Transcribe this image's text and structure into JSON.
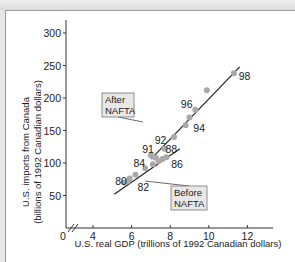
{
  "chart_data": {
    "type": "scatter",
    "title": "",
    "xlabel": "U.S. real GDP (trillions of 1992 Canadian dollars)",
    "ylabel": "U.S. imports from Canada (billions of 1992 Canadian dollars)",
    "ylabel_line1": "U.S. imports from Canada",
    "ylabel_line2": "(billions of 1992 Canadian dollars)",
    "xlim": [
      0,
      13
    ],
    "ylim": [
      0,
      320
    ],
    "x_ticks": [
      4,
      6,
      8,
      10,
      12
    ],
    "y_ticks": [
      50,
      100,
      150,
      200,
      250,
      300
    ],
    "origin_label": "0",
    "axis_break": true,
    "grid": false,
    "series": [
      {
        "name": "Before NAFTA",
        "points": [
          {
            "year": "80",
            "x": 5.6,
            "y": 70
          },
          {
            "year": "81",
            "x": 5.8,
            "y": 72
          },
          {
            "year": "82",
            "x": 5.9,
            "y": 76
          },
          {
            "year": "83",
            "x": 6.2,
            "y": 82
          },
          {
            "year": "84",
            "x": 6.7,
            "y": 92
          },
          {
            "year": "85",
            "x": 7.1,
            "y": 98
          },
          {
            "year": "86",
            "x": 7.4,
            "y": 103
          },
          {
            "year": "87",
            "x": 7.6,
            "y": 106
          },
          {
            "year": "88",
            "x": 7.8,
            "y": 109
          }
        ],
        "trend_line": {
          "x0": 5.1,
          "y0": 52,
          "x1": 8.5,
          "y1": 122
        }
      },
      {
        "name": "After NAFTA",
        "points": [
          {
            "year": "89",
            "x": 7.0,
            "y": 112
          },
          {
            "year": "90",
            "x": 7.1,
            "y": 110
          },
          {
            "year": "91",
            "x": 7.25,
            "y": 108
          },
          {
            "year": "92",
            "x": 7.7,
            "y": 122
          },
          {
            "year": "93",
            "x": 8.2,
            "y": 140
          },
          {
            "year": "94",
            "x": 8.8,
            "y": 158
          },
          {
            "year": "95",
            "x": 9.0,
            "y": 170
          },
          {
            "year": "96",
            "x": 9.3,
            "y": 182
          },
          {
            "year": "97",
            "x": 9.9,
            "y": 212
          },
          {
            "year": "98",
            "x": 11.3,
            "y": 238
          }
        ],
        "trend_line": {
          "x0": 7.0,
          "y0": 106,
          "x1": 11.6,
          "y1": 248
        }
      }
    ],
    "point_labels": [
      {
        "text": "80",
        "x": 5.15,
        "y": 66
      },
      {
        "text": "82",
        "x": 6.3,
        "y": 57
      },
      {
        "text": "84",
        "x": 6.1,
        "y": 94
      },
      {
        "text": "86",
        "x": 8.05,
        "y": 92
      },
      {
        "text": "88",
        "x": 7.75,
        "y": 115
      },
      {
        "text": "91",
        "x": 6.55,
        "y": 115
      },
      {
        "text": "92",
        "x": 7.2,
        "y": 129
      },
      {
        "text": "94",
        "x": 9.2,
        "y": 147
      },
      {
        "text": "96",
        "x": 8.55,
        "y": 184
      },
      {
        "text": "98",
        "x": 11.55,
        "y": 228
      }
    ],
    "annotations": [
      {
        "line1": "After",
        "line2": "NAFTA",
        "box_x": 102,
        "box_y": 93,
        "pointer_to": [
          143,
          122
        ]
      },
      {
        "line1": "Before",
        "line2": "NAFTA",
        "box_x": 171,
        "box_y": 186,
        "pointer_to": [
          145,
          181
        ]
      }
    ],
    "legend": null
  }
}
